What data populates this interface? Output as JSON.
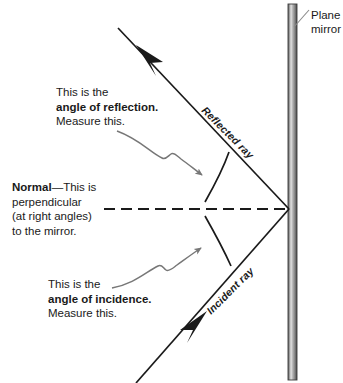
{
  "diagram": {
    "colors": {
      "ray": "#1a1a1a",
      "normal": "#1a1a1a",
      "arc": "#1a1a1a",
      "pointer": "#777777",
      "leader": "#8a8a8a",
      "mirror_dark": "#4a4a4a",
      "mirror_light": "#d9d9d9",
      "text": "#1a1a1a",
      "background": "#ffffff"
    },
    "mirror": {
      "label_line1": "Plane",
      "label_line2": "mirror"
    },
    "rays": {
      "reflected_label": "Reflected ray",
      "incident_label": "Incident ray"
    },
    "annotations": {
      "reflection": {
        "line1": "This is the",
        "line2": "angle of reflection.",
        "line3": "Measure this."
      },
      "normal": {
        "line1_bold": "Normal",
        "line1_rest": "—This is",
        "line2": "perpendicular",
        "line3": "(at right angles)",
        "line4": "to the mirror."
      },
      "incidence": {
        "line1": "This is the",
        "line2": "angle of incidence.",
        "line3": "Measure this."
      }
    }
  }
}
